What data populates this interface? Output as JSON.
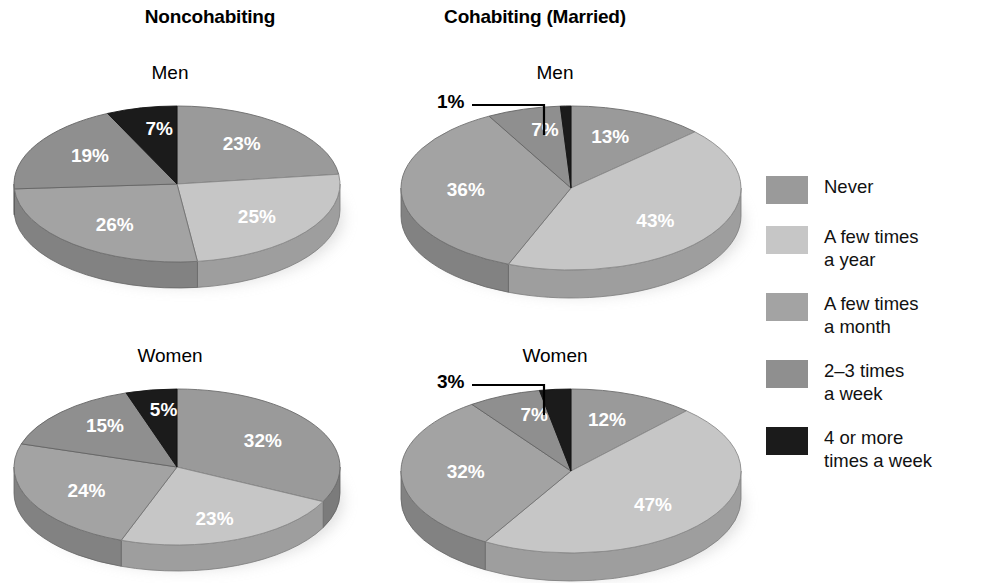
{
  "chart_data": {
    "type": "pie",
    "title": "",
    "subtitle": "",
    "legend_position": "right",
    "grid": false,
    "categories": [
      "Never",
      "A few times a year",
      "A few times a month",
      "2-3 times a week",
      "4 or more times a week"
    ],
    "series_colors": [
      "#9a9a9a",
      "#c6c6c6",
      "#a3a3a3",
      "#8f8f8f",
      "#1b1b1b"
    ],
    "panels": [
      {
        "group": "Noncohabiting",
        "sex": "Men",
        "values": [
          23,
          25,
          26,
          19,
          7
        ],
        "labels": [
          "23%",
          "25%",
          "26%",
          "19%",
          "7%"
        ],
        "callout": null
      },
      {
        "group": "Cohabiting (Married)",
        "sex": "Men",
        "values": [
          13,
          43,
          36,
          7,
          1
        ],
        "labels": [
          "13%",
          "43%",
          "36%",
          "7%",
          "1%"
        ],
        "callout": {
          "label": "1%",
          "for_category": "4 or more times a week"
        }
      },
      {
        "group": "Noncohabiting",
        "sex": "Women",
        "values": [
          32,
          23,
          24,
          15,
          5
        ],
        "labels": [
          "32%",
          "23%",
          "24%",
          "15%",
          "5%"
        ],
        "callout": null
      },
      {
        "group": "Cohabiting (Married)",
        "sex": "Women",
        "values": [
          12,
          47,
          32,
          7,
          3
        ],
        "labels": [
          "12%",
          "47%",
          "32%",
          "7%",
          "3%"
        ],
        "callout": {
          "label": "3%",
          "for_category": "4 or more times a week"
        }
      }
    ]
  },
  "columns": [
    {
      "title": "Noncohabiting"
    },
    {
      "title": "Cohabiting (Married)"
    }
  ],
  "panels": {
    "noncohab_men": {
      "title": "Men",
      "labels": [
        "23%",
        "25%",
        "26%",
        "19%",
        "7%"
      ]
    },
    "cohab_men": {
      "title": "Men",
      "labels": [
        "13%",
        "43%",
        "36%",
        "7%"
      ],
      "callout": "1%"
    },
    "noncohab_women": {
      "title": "Women",
      "labels": [
        "32%",
        "23%",
        "24%",
        "15%",
        "5%"
      ]
    },
    "cohab_women": {
      "title": "Women",
      "labels": [
        "12%",
        "47%",
        "32%",
        "7%"
      ],
      "callout": "3%"
    }
  },
  "legend": {
    "items": [
      {
        "label": "Never",
        "color": "#9a9a9a"
      },
      {
        "label": "A few times\na year",
        "color": "#c6c6c6"
      },
      {
        "label": "A few times\na month",
        "color": "#a3a3a3"
      },
      {
        "label": "2–3 times\na week",
        "color": "#8f8f8f"
      },
      {
        "label": "4 or more\ntimes a week",
        "color": "#1b1b1b"
      }
    ]
  }
}
